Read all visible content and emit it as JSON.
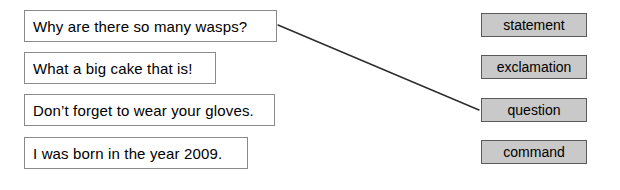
{
  "exercise": {
    "type": "matching",
    "prompts": [
      {
        "id": "prompt-1",
        "text": "Why are there so many wasps?"
      },
      {
        "id": "prompt-2",
        "text": "What a big cake that is!"
      },
      {
        "id": "prompt-3",
        "text": "Don’t forget to wear your gloves."
      },
      {
        "id": "prompt-4",
        "text": "I was born in the year 2009."
      }
    ],
    "categories": [
      {
        "id": "category-1",
        "label": "statement"
      },
      {
        "id": "category-2",
        "label": "exclamation"
      },
      {
        "id": "category-3",
        "label": "question"
      },
      {
        "id": "category-4",
        "label": "command"
      }
    ],
    "connections": [
      {
        "from": "prompt-1",
        "to": "category-3",
        "x1": 278,
        "y1": 25,
        "x2": 479,
        "y2": 110
      }
    ]
  },
  "colors": {
    "prompt_fill": "#ffffff",
    "prompt_border": "#8a8a8a",
    "category_fill": "#c9c9c9",
    "category_border": "#5a5a5a",
    "connector_stroke": "#2b2b2b",
    "text": "#000000",
    "background": "#ffffff"
  }
}
